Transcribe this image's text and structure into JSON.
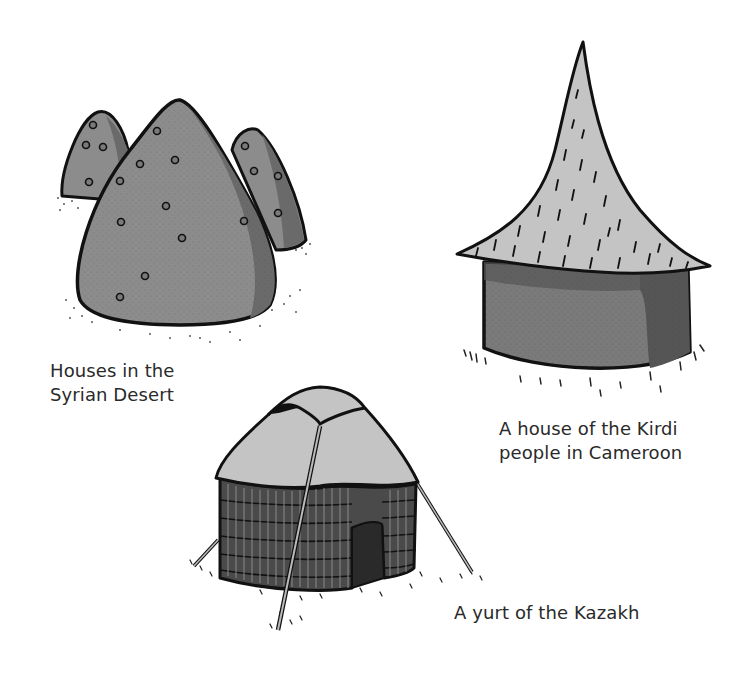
{
  "illustrations": [
    {
      "id": "syrian-desert",
      "caption_lines": [
        "Houses in the",
        "Syrian Desert"
      ]
    },
    {
      "id": "kirdi-house",
      "caption_lines": [
        "A house of the Kirdi",
        "people in Cameroon"
      ]
    },
    {
      "id": "kazakh-yurt",
      "caption_lines": [
        "A yurt of the Kazakh"
      ]
    }
  ],
  "colors": {
    "ink": "#111111",
    "desert_fill": "#8c8c8c",
    "desert_shadow": "#6a6a6a",
    "roof_fill": "#c4c4c4",
    "kirdi_wall": "#7a7a7a",
    "kirdi_wall_shadow": "#555555",
    "yurt_wall": "#4a4a4a",
    "caption": "#2a2a2a"
  }
}
